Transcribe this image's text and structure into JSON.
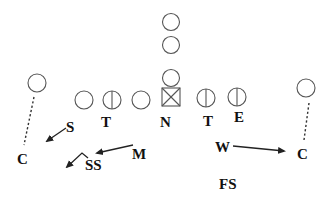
{
  "diagram": {
    "offense": {
      "linemen": [
        {
          "id": "ol1",
          "x": 84,
          "y": 100,
          "type": "circle"
        },
        {
          "id": "ol2",
          "x": 112,
          "y": 100,
          "type": "circle-split"
        },
        {
          "id": "ol3",
          "x": 141,
          "y": 100,
          "type": "circle"
        },
        {
          "id": "center",
          "x": 171,
          "y": 100,
          "type": "square-x"
        },
        {
          "id": "ol5",
          "x": 206,
          "y": 98,
          "type": "circle-split"
        },
        {
          "id": "ol6",
          "x": 237,
          "y": 97,
          "type": "circle-split"
        }
      ],
      "backs": [
        {
          "id": "qb",
          "x": 171,
          "y": 78,
          "type": "circle"
        },
        {
          "id": "fb",
          "x": 171,
          "y": 45,
          "type": "circle"
        },
        {
          "id": "tb",
          "x": 171,
          "y": 22,
          "type": "circle"
        }
      ],
      "wide_receivers": [
        {
          "id": "wr-left",
          "x": 37,
          "y": 83,
          "type": "circle"
        },
        {
          "id": "wr-right",
          "x": 306,
          "y": 88,
          "type": "circle"
        }
      ]
    },
    "defense": {
      "labels": [
        {
          "id": "S",
          "text": "S",
          "x": 71,
          "y": 131
        },
        {
          "id": "T-left",
          "text": "T",
          "x": 106,
          "y": 126
        },
        {
          "id": "N",
          "text": "N",
          "x": 166,
          "y": 126
        },
        {
          "id": "T-right",
          "text": "T",
          "x": 208,
          "y": 126
        },
        {
          "id": "E",
          "text": "E",
          "x": 239,
          "y": 122
        },
        {
          "id": "C-left",
          "text": "C",
          "x": 22,
          "y": 163
        },
        {
          "id": "SS",
          "text": "SS",
          "x": 87,
          "y": 169
        },
        {
          "id": "M",
          "text": "M",
          "x": 136,
          "y": 159
        },
        {
          "id": "W",
          "text": "W",
          "x": 217,
          "y": 151
        },
        {
          "id": "C-right",
          "text": "C",
          "x": 298,
          "y": 158
        },
        {
          "id": "FS",
          "text": "FS",
          "x": 220,
          "y": 189
        }
      ],
      "arrows": [
        {
          "id": "S-drop",
          "from": [
            66,
            128
          ],
          "to": [
            47,
            141
          ]
        },
        {
          "id": "M-drop",
          "from": [
            133,
            145
          ],
          "to": [
            97,
            153
          ]
        },
        {
          "id": "W-drop",
          "from": [
            233,
            146
          ],
          "to": [
            284,
            151
          ]
        },
        {
          "id": "SS-drop",
          "path": "M 88 158 L 82 153 L 67 167"
        }
      ],
      "dashed_lines": [
        {
          "id": "C-left-cover",
          "from": [
            34,
            97
          ],
          "to": [
            24,
            145
          ]
        },
        {
          "id": "C-right-cover",
          "from": [
            309,
            103
          ],
          "to": [
            304,
            140
          ]
        }
      ]
    }
  }
}
